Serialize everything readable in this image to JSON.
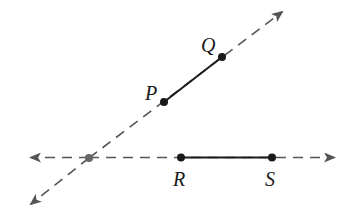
{
  "diagram": {
    "type": "geometry",
    "colors": {
      "line": "#555555",
      "segment": "#1a1a1a",
      "point": "#1a1a1a",
      "intersection": "#666666",
      "background": "#ffffff"
    },
    "lines": [
      {
        "name": "oblique-line",
        "from": [
          30,
          205
        ],
        "to": [
          283,
          11
        ],
        "style": "dashed",
        "arrows": "both"
      },
      {
        "name": "horizontal-line",
        "from": [
          30,
          157
        ],
        "to": [
          335,
          157
        ],
        "style": "dashed",
        "arrows": "both"
      }
    ],
    "segments": [
      {
        "name": "PQ",
        "from": "P",
        "to": "Q"
      },
      {
        "name": "RS",
        "from": "R",
        "to": "S"
      }
    ],
    "points": {
      "P": {
        "label": "P",
        "x": 164,
        "y": 102
      },
      "Q": {
        "label": "Q",
        "x": 222,
        "y": 57
      },
      "R": {
        "label": "R",
        "x": 181,
        "y": 157
      },
      "S": {
        "label": "S",
        "x": 272,
        "y": 157
      },
      "intersection": {
        "x": 89,
        "y": 158
      }
    },
    "labels": {
      "P": "P",
      "Q": "Q",
      "R": "R",
      "S": "S"
    }
  }
}
